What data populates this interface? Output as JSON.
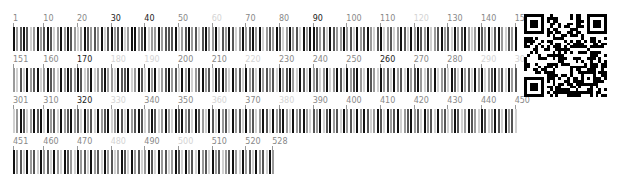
{
  "sequence_map": {
    "length": 528,
    "per_row": 150,
    "shade_colors": {
      "0": "#111111",
      "1": "#555555",
      "2": "#9a9a9a",
      "3": "#d0d0d0"
    },
    "rows": [
      {
        "start": 1,
        "end": 150,
        "labels": [
          1,
          10,
          20,
          30,
          40,
          50,
          60,
          70,
          80,
          90,
          100,
          110,
          120,
          130,
          140,
          150
        ]
      },
      {
        "start": 151,
        "end": 300,
        "labels": [
          151,
          160,
          170,
          180,
          190,
          200,
          210,
          220,
          230,
          240,
          250,
          260,
          270,
          280,
          290,
          300
        ]
      },
      {
        "start": 301,
        "end": 450,
        "labels": [
          301,
          310,
          320,
          330,
          340,
          350,
          360,
          370,
          380,
          390,
          400,
          410,
          420,
          430,
          440,
          450
        ]
      },
      {
        "start": 451,
        "end": 528,
        "labels": [
          451,
          460,
          470,
          480,
          490,
          500,
          510,
          520,
          528
        ]
      }
    ],
    "faint_labels": [
      60,
      120,
      180,
      190,
      220,
      290,
      300,
      330,
      360,
      380,
      480,
      500
    ],
    "dark_labels": [
      30,
      40,
      90,
      170,
      260,
      320
    ],
    "shades": "021013202101320201232012120310210320021032202111032102131022031201320210203212013202130200121301220213021023103213201302012032102130210232012031023120231302103201230201201320321022301103201302032102130203210213010230213021302121302102301302132032013021023012302130213021023120321301302130203210213021320132010302130210213021302103201302101320132023010213012301302130213021320130210230210231203102130213020132013021032102130213021320132012301320130213021302130213023012302130213021320130213201302132013021302130213210230213021302103"
  },
  "qr_code": {
    "label": "qr-code"
  }
}
